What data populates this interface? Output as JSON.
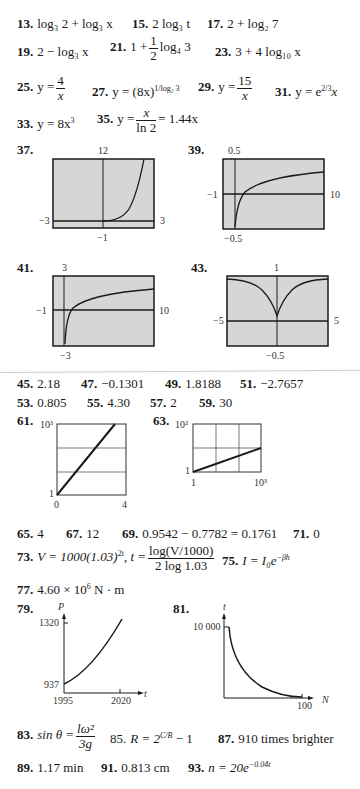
{
  "answers": {
    "a13": {
      "num": "13.",
      "text": "log₃ 2 + log₃ x"
    },
    "a15": {
      "num": "15.",
      "text": "2 log₃ t"
    },
    "a17": {
      "num": "17.",
      "text": "2 + log₂ 7"
    },
    "a19": {
      "num": "19.",
      "text": "2 − log₃ x"
    },
    "a21": {
      "num": "21.",
      "prefix": "1 +",
      "frac_top": "1",
      "frac_bottom": "2",
      "suffix": "log₄ 3"
    },
    "a23": {
      "num": "23.",
      "text": "3 + 4 log₁₀ x"
    },
    "a25": {
      "num": "25.",
      "prefix": "y =",
      "frac_top": "4",
      "frac_bottom": "x"
    },
    "a27": {
      "num": "27.",
      "text": "y = (8x)",
      "sup": "1/log₂ 3"
    },
    "a29": {
      "num": "29.",
      "prefix": "y =",
      "frac_top": "15",
      "frac_bottom": "x"
    },
    "a31": {
      "num": "31.",
      "text": "y = e",
      "sup": "2/3",
      "suffix": "x"
    },
    "a33": {
      "num": "33.",
      "text": "y = 8x",
      "sup": "3"
    },
    "a35": {
      "num": "35.",
      "prefix": "y =",
      "frac_top": "x",
      "frac_bottom": "ln 2",
      "suffix": "= 1.44x"
    },
    "a37": {
      "num": "37."
    },
    "a39": {
      "num": "39."
    },
    "a41": {
      "num": "41."
    },
    "a43": {
      "num": "43."
    },
    "a45": {
      "num": "45.",
      "text": "2.18"
    },
    "a47": {
      "num": "47.",
      "text": "−0.1301"
    },
    "a49": {
      "num": "49.",
      "text": "1.8188"
    },
    "a51": {
      "num": "51.",
      "text": "−2.7657"
    },
    "a53": {
      "num": "53.",
      "text": "0.805"
    },
    "a55": {
      "num": "55.",
      "text": "4.30"
    },
    "a57": {
      "num": "57.",
      "text": "2"
    },
    "a59": {
      "num": "59.",
      "text": "30"
    },
    "a61": {
      "num": "61."
    },
    "a63": {
      "num": "63."
    },
    "a65": {
      "num": "65.",
      "text": "4"
    },
    "a67": {
      "num": "67.",
      "text": "12"
    },
    "a69": {
      "num": "69.",
      "text": "0.9542 − 0.7782 = 0.1761"
    },
    "a71": {
      "num": "71.",
      "text": "0"
    },
    "a73": {
      "num": "73.",
      "prefix": "V = 1000(1.03)",
      "sup": "2t",
      "mid": ", t =",
      "frac_top": "log(V/1000)",
      "frac_bottom": "2 log 1.03"
    },
    "a75": {
      "num": "75.",
      "text": "I = I₀e",
      "sup": "−βh"
    },
    "a77": {
      "num": "77.",
      "text": "4.60 × 10",
      "sup": "6",
      "suffix": " N · m"
    },
    "a79": {
      "num": "79."
    },
    "a81": {
      "num": "81."
    },
    "a83": {
      "num": "83.",
      "prefix": "sin θ =",
      "frac_top": "lω²",
      "frac_bottom": "3g"
    },
    "a85": {
      "num": "85.",
      "text": "R = 2",
      "sup": "C/B",
      "suffix": " − 1"
    },
    "a87": {
      "num": "87.",
      "text": "910 times brighter"
    },
    "a89": {
      "num": "89.",
      "text": "1.17 min"
    },
    "a91": {
      "num": "91.",
      "text": "0.813 cm"
    },
    "a93": {
      "num": "93.",
      "text": "n = 20e",
      "sup": "−0.04t"
    }
  },
  "plots": {
    "p37": {
      "top": "12",
      "bottom": "−1",
      "left": "−3",
      "right": "3"
    },
    "p39": {
      "top": "0.5",
      "bottom": "−0.5",
      "left": "−1",
      "right": "10"
    },
    "p41": {
      "top": "3",
      "bottom": "−3",
      "left": "−1",
      "right": "10"
    },
    "p43": {
      "top": "1",
      "bottom": "−0.5",
      "left": "−5",
      "right": "5"
    },
    "p61": {
      "ytop": "10³",
      "ybottom": "1",
      "xleft": "0",
      "xright": "4"
    },
    "p63": {
      "ytop": "10²",
      "ybottom": "1",
      "xleft": "1",
      "xright": "10³"
    },
    "p79": {
      "yaxis": "P",
      "xaxis": "t",
      "ytop": "1320",
      "ybottom": "937",
      "xleft": "1995",
      "xright": "2020"
    },
    "p81": {
      "yaxis": "t",
      "xaxis": "N",
      "ytop": "10 000",
      "xright": "100"
    }
  },
  "colors": {
    "screen_bg": "#d6d6d6",
    "ink": "#1a1a1a"
  }
}
